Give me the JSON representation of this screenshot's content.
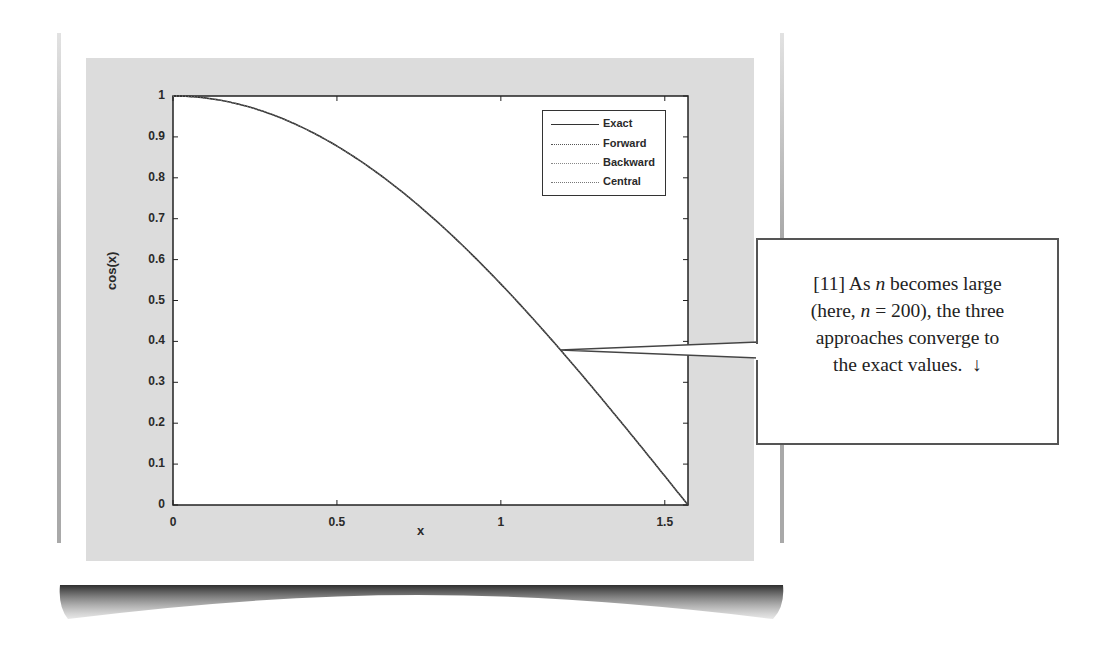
{
  "chart_data": {
    "type": "line",
    "title": "",
    "xlabel": "x",
    "ylabel": "cos(x)",
    "xlim": [
      0,
      1.5708
    ],
    "ylim": [
      0,
      1
    ],
    "grid": false,
    "legend_position": "upper right (inside)",
    "x_ticks": [
      "0",
      "0.5",
      "1",
      "1.5"
    ],
    "y_ticks": [
      "0",
      "0.1",
      "0.2",
      "0.3",
      "0.4",
      "0.5",
      "0.6",
      "0.7",
      "0.8",
      "0.9",
      "1"
    ],
    "x": [
      0,
      0.1571,
      0.3142,
      0.4712,
      0.6283,
      0.7854,
      0.9425,
      1.0996,
      1.2566,
      1.4137,
      1.5708
    ],
    "series": [
      {
        "name": "Exact",
        "style": "solid",
        "values": [
          1,
          0.9877,
          0.9511,
          0.891,
          0.809,
          0.7071,
          0.5878,
          0.454,
          0.309,
          0.1564,
          0
        ]
      },
      {
        "name": "Forward",
        "style": "dotted",
        "values": [
          1,
          0.9877,
          0.9511,
          0.891,
          0.809,
          0.7071,
          0.5878,
          0.454,
          0.309,
          0.1564,
          0
        ]
      },
      {
        "name": "Backward",
        "style": "dotted",
        "values": [
          1,
          0.9877,
          0.9511,
          0.891,
          0.809,
          0.7071,
          0.5878,
          0.454,
          0.309,
          0.1564,
          0
        ]
      },
      {
        "name": "Central",
        "style": "dotted",
        "values": [
          1,
          0.9877,
          0.9511,
          0.891,
          0.809,
          0.7071,
          0.5878,
          0.454,
          0.309,
          0.1564,
          0
        ]
      }
    ],
    "annotations": [
      {
        "text": "[11] As n becomes large (here, n = 200), the three approaches converge to the exact values. ↓",
        "points_to": {
          "x": 1.18,
          "y": 0.38
        }
      }
    ]
  },
  "figure": {
    "xlabel": "x",
    "ylabel": "cos(x)",
    "y_ticks": [
      "1",
      "0.9",
      "0.8",
      "0.7",
      "0.6",
      "0.5",
      "0.4",
      "0.3",
      "0.2",
      "0.1",
      "0"
    ],
    "x_ticks": [
      "0",
      "0.5",
      "1",
      "1.5"
    ],
    "legend": [
      "Exact",
      "Forward",
      "Backward",
      "Central"
    ]
  },
  "callout": {
    "number": "[11]",
    "line1_a": "As ",
    "n": "n",
    "line1_b": " becomes large",
    "line2_a": "(here, ",
    "line2_b": " = 200), the three",
    "line3": "approaches converge to",
    "line4": "the exact values.",
    "arrow": "↓"
  },
  "colors": {
    "figure_bg": "#dcdcdc",
    "axes_bg": "#ffffff",
    "line": "#333333",
    "text": "#2a2a2a"
  }
}
